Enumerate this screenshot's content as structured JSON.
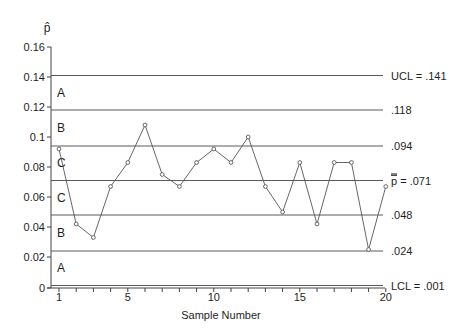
{
  "chart_data": {
    "type": "line",
    "title": "",
    "subtitle": "",
    "xlabel": "Sample Number",
    "ylabel": "p̂",
    "x": [
      1,
      2,
      3,
      4,
      5,
      6,
      7,
      8,
      9,
      10,
      11,
      12,
      13,
      14,
      15,
      16,
      17,
      18,
      19,
      20
    ],
    "series": [
      {
        "name": "p̂",
        "values": [
          0.092,
          0.042,
          0.033,
          0.067,
          0.083,
          0.108,
          0.075,
          0.067,
          0.083,
          0.092,
          0.083,
          0.1,
          0.067,
          0.05,
          0.083,
          0.042,
          0.083,
          0.083,
          0.025,
          0.067
        ],
        "marker": "open-circle",
        "color": "#555555"
      }
    ],
    "ylim": [
      0,
      0.16
    ],
    "xlim": [
      1,
      20
    ],
    "yticks": [
      0,
      0.02,
      0.04,
      0.06,
      0.08,
      0.1,
      0.12,
      0.14,
      0.16
    ],
    "ytick_labels": [
      "0",
      "0.02",
      "0.04",
      "0.06",
      "0.08",
      "0.1",
      "0.12",
      "0.14",
      "0.16"
    ],
    "xticks": [
      1,
      2,
      3,
      4,
      5,
      6,
      7,
      8,
      9,
      10,
      11,
      12,
      13,
      14,
      15,
      16,
      17,
      18,
      19,
      20
    ],
    "xtick_labels": [
      {
        "x": 1,
        "label": "1"
      },
      {
        "x": 5,
        "label": "5"
      },
      {
        "x": 10,
        "label": "10"
      },
      {
        "x": 15,
        "label": "15"
      },
      {
        "x": 20,
        "label": "20"
      }
    ],
    "grid": false,
    "legend": null,
    "reference_lines": [
      {
        "name": "ucl",
        "value": 0.141,
        "label": "UCL = .141"
      },
      {
        "name": "zone-ab-upper",
        "value": 0.118,
        "label": ".118"
      },
      {
        "name": "zone-bc-upper",
        "value": 0.094,
        "label": ".094"
      },
      {
        "name": "center-line",
        "value": 0.071,
        "label_symbol": "p",
        "label": " = .071",
        "overline_symbol": true
      },
      {
        "name": "zone-bc-lower",
        "value": 0.048,
        "label": ".048"
      },
      {
        "name": "zone-ab-lower",
        "value": 0.024,
        "label": ".024"
      },
      {
        "name": "lcl",
        "value": 0.001,
        "label": "LCL = .001"
      }
    ],
    "zones": [
      {
        "label": "A",
        "center": 0.1295
      },
      {
        "label": "B",
        "center": 0.106
      },
      {
        "label": "C",
        "center": 0.0825
      },
      {
        "label": "C",
        "center": 0.0595
      },
      {
        "label": "B",
        "center": 0.036
      },
      {
        "label": "A",
        "center": 0.0125
      }
    ]
  }
}
